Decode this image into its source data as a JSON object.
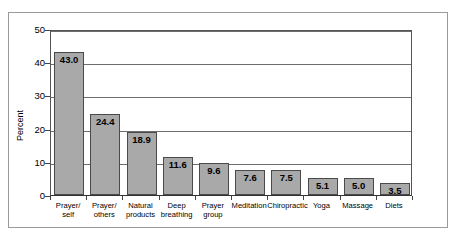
{
  "chart_data": {
    "type": "bar",
    "title": "",
    "xlabel": "",
    "ylabel": "Percent",
    "ylim": [
      0,
      50
    ],
    "yticks": [
      0,
      10,
      20,
      30,
      40,
      50
    ],
    "ytick_labels": [
      "0",
      "10",
      "20",
      "30",
      "40",
      "50"
    ],
    "grid": true,
    "legend": "none",
    "categories": [
      "Prayer/ self",
      "Prayer/ others",
      "Natural products",
      "Deep breathing",
      "Prayer group",
      "Meditation",
      "Chiropractic",
      "Yoga",
      "Massage",
      "Diets"
    ],
    "category_lines": [
      [
        "Prayer/",
        "self"
      ],
      [
        "Prayer/",
        "others"
      ],
      [
        "Natural",
        "products"
      ],
      [
        "Deep",
        "breathing"
      ],
      [
        "Prayer",
        "group"
      ],
      [
        "Meditation"
      ],
      [
        "Chiropractic"
      ],
      [
        "Yoga"
      ],
      [
        "Massage"
      ],
      [
        "Diets"
      ]
    ],
    "values": [
      43.0,
      24.4,
      18.9,
      11.6,
      9.6,
      7.6,
      7.5,
      5.1,
      5.0,
      3.5
    ],
    "value_labels": [
      "43.0",
      "24.4",
      "18.9",
      "11.6",
      "9.6",
      "7.6",
      "7.5",
      "5.1",
      "5.0",
      "3.5"
    ],
    "colors": {
      "bar_fill": "#a9a9a9",
      "bar_edge": "#4a4a4a",
      "gridline": "#6d6d6d",
      "axis": "#555555",
      "frame": "#9a9a9a",
      "text": "#000000",
      "background": "#ffffff"
    }
  }
}
